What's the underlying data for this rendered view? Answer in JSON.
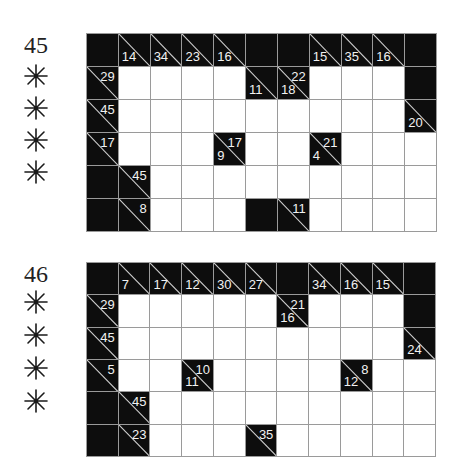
{
  "puzzles": [
    {
      "number": "45",
      "difficulty_stars": 4,
      "star_icon": "asterisk-star-icon",
      "rows": 6,
      "cols": 11,
      "cells": [
        [
          {
            "t": "B"
          },
          {
            "t": "C",
            "d": "14"
          },
          {
            "t": "C",
            "d": "34"
          },
          {
            "t": "C",
            "d": "23"
          },
          {
            "t": "C",
            "d": "16"
          },
          {
            "t": "B"
          },
          {
            "t": "B"
          },
          {
            "t": "C",
            "d": "15"
          },
          {
            "t": "C",
            "d": "35"
          },
          {
            "t": "C",
            "d": "16"
          },
          {
            "t": "B"
          }
        ],
        [
          {
            "t": "C",
            "a": "29"
          },
          {
            "t": "W"
          },
          {
            "t": "W"
          },
          {
            "t": "W"
          },
          {
            "t": "W"
          },
          {
            "t": "C",
            "d": "11"
          },
          {
            "t": "C",
            "d": "18",
            "a": "22"
          },
          {
            "t": "W"
          },
          {
            "t": "W"
          },
          {
            "t": "W"
          },
          {
            "t": "B"
          }
        ],
        [
          {
            "t": "C",
            "a": "45"
          },
          {
            "t": "W"
          },
          {
            "t": "W"
          },
          {
            "t": "W"
          },
          {
            "t": "W"
          },
          {
            "t": "W"
          },
          {
            "t": "W"
          },
          {
            "t": "W"
          },
          {
            "t": "W"
          },
          {
            "t": "W"
          },
          {
            "t": "C",
            "d": "20"
          }
        ],
        [
          {
            "t": "C",
            "a": "17"
          },
          {
            "t": "W"
          },
          {
            "t": "W"
          },
          {
            "t": "W"
          },
          {
            "t": "C",
            "d": "9",
            "a": "17"
          },
          {
            "t": "W"
          },
          {
            "t": "W"
          },
          {
            "t": "C",
            "d": "4",
            "a": "21"
          },
          {
            "t": "W"
          },
          {
            "t": "W"
          },
          {
            "t": "W"
          }
        ],
        [
          {
            "t": "B"
          },
          {
            "t": "C",
            "a": "45"
          },
          {
            "t": "W"
          },
          {
            "t": "W"
          },
          {
            "t": "W"
          },
          {
            "t": "W"
          },
          {
            "t": "W"
          },
          {
            "t": "W"
          },
          {
            "t": "W"
          },
          {
            "t": "W"
          },
          {
            "t": "W"
          }
        ],
        [
          {
            "t": "B"
          },
          {
            "t": "C",
            "a": "8"
          },
          {
            "t": "W"
          },
          {
            "t": "W"
          },
          {
            "t": "W"
          },
          {
            "t": "B"
          },
          {
            "t": "C",
            "a": "11"
          },
          {
            "t": "W"
          },
          {
            "t": "W"
          },
          {
            "t": "W"
          },
          {
            "t": "W"
          }
        ]
      ]
    },
    {
      "number": "46",
      "difficulty_stars": 4,
      "star_icon": "asterisk-star-icon",
      "rows": 6,
      "cols": 11,
      "cells": [
        [
          {
            "t": "B"
          },
          {
            "t": "C",
            "d": "7"
          },
          {
            "t": "C",
            "d": "17"
          },
          {
            "t": "C",
            "d": "12"
          },
          {
            "t": "C",
            "d": "30"
          },
          {
            "t": "C",
            "d": "27"
          },
          {
            "t": "B"
          },
          {
            "t": "C",
            "d": "34"
          },
          {
            "t": "C",
            "d": "16"
          },
          {
            "t": "C",
            "d": "15"
          },
          {
            "t": "B"
          }
        ],
        [
          {
            "t": "C",
            "a": "29"
          },
          {
            "t": "W"
          },
          {
            "t": "W"
          },
          {
            "t": "W"
          },
          {
            "t": "W"
          },
          {
            "t": "W"
          },
          {
            "t": "C",
            "d": "16",
            "a": "21"
          },
          {
            "t": "W"
          },
          {
            "t": "W"
          },
          {
            "t": "W"
          },
          {
            "t": "B"
          }
        ],
        [
          {
            "t": "C",
            "a": "45"
          },
          {
            "t": "W"
          },
          {
            "t": "W"
          },
          {
            "t": "W"
          },
          {
            "t": "W"
          },
          {
            "t": "W"
          },
          {
            "t": "W"
          },
          {
            "t": "W"
          },
          {
            "t": "W"
          },
          {
            "t": "W"
          },
          {
            "t": "C",
            "d": "24"
          }
        ],
        [
          {
            "t": "C",
            "a": "5"
          },
          {
            "t": "W"
          },
          {
            "t": "W"
          },
          {
            "t": "C",
            "d": "11",
            "a": "10"
          },
          {
            "t": "W"
          },
          {
            "t": "W"
          },
          {
            "t": "W"
          },
          {
            "t": "W"
          },
          {
            "t": "C",
            "d": "12",
            "a": "8"
          },
          {
            "t": "W"
          },
          {
            "t": "W"
          }
        ],
        [
          {
            "t": "B"
          },
          {
            "t": "C",
            "a": "45"
          },
          {
            "t": "W"
          },
          {
            "t": "W"
          },
          {
            "t": "W"
          },
          {
            "t": "W"
          },
          {
            "t": "W"
          },
          {
            "t": "W"
          },
          {
            "t": "W"
          },
          {
            "t": "W"
          },
          {
            "t": "W"
          }
        ],
        [
          {
            "t": "B"
          },
          {
            "t": "C",
            "a": "23"
          },
          {
            "t": "W"
          },
          {
            "t": "W"
          },
          {
            "t": "W"
          },
          {
            "t": "C",
            "a": "35"
          },
          {
            "t": "W"
          },
          {
            "t": "W"
          },
          {
            "t": "W"
          },
          {
            "t": "W"
          },
          {
            "t": "W"
          }
        ]
      ]
    }
  ],
  "colors": {
    "block": "#0d0d0d",
    "grid_line": "#9a9a9a",
    "clue_text": "#f2f2f2",
    "empty_cell": "#ffffff"
  }
}
